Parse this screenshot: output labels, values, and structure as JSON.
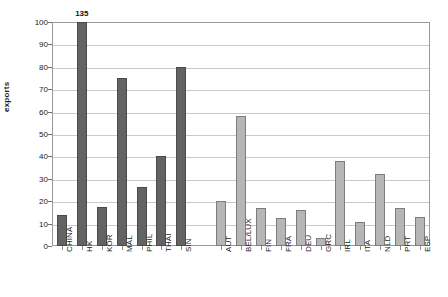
{
  "chart_data": {
    "type": "bar",
    "title": "",
    "subtitle": "",
    "xlabel": "",
    "ylabel": "exports",
    "ylim": [
      0,
      100
    ],
    "ytick_values": [
      0,
      10,
      20,
      30,
      40,
      50,
      60,
      70,
      80,
      90,
      100
    ],
    "ytick_labels": [
      "0",
      "10",
      "20",
      "30",
      "40",
      "50",
      "60",
      "70",
      "80",
      "90",
      "100"
    ],
    "grid": true,
    "legend": "none",
    "categories": [
      "CHINA",
      "HK",
      "KOR",
      "MAL",
      "PHIL",
      "THAI",
      "SIN",
      "AUT",
      "BEL/LUX",
      "FIN",
      "FRA",
      "DEU",
      "GRC",
      "IRL",
      "ITA",
      "NLD",
      "PRT",
      "ESP"
    ],
    "values": [
      14,
      135,
      17.5,
      75,
      26.5,
      40,
      80,
      20,
      58,
      17,
      12.5,
      16,
      3.5,
      38,
      10.5,
      32,
      17,
      13
    ],
    "annotations": [
      {
        "category": "HK",
        "text": "135",
        "note": "value exceeds axis maximum; bar clipped at 100"
      }
    ],
    "groups": [
      {
        "name": "asia",
        "color": "#636363",
        "categories": [
          "CHINA",
          "HK",
          "KOR",
          "MAL",
          "PHIL",
          "THAI",
          "SIN"
        ]
      },
      {
        "name": "europe",
        "color": "#b6b6b6",
        "categories": [
          "AUT",
          "BEL/LUX",
          "FIN",
          "FRA",
          "DEU",
          "GRC",
          "IRL",
          "ITA",
          "NLD",
          "PRT",
          "ESP"
        ]
      }
    ],
    "gap_after_category": "SIN"
  },
  "colors": {
    "asia_bar": "#636363",
    "europe_bar": "#b6b6b6",
    "grid": "#c9c9c9",
    "frame": "#9a9a9a",
    "text": "#1a1a1a",
    "background": "#ffffff"
  }
}
